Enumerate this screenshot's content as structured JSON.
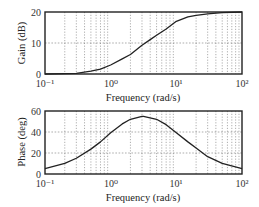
{
  "chart_data": [
    {
      "type": "line",
      "title": "",
      "xlabel": "Frequency (rad/s)",
      "ylabel": "Gain (dB)",
      "xscale": "log",
      "xlim": [
        0.1,
        100
      ],
      "ylim": [
        0,
        20
      ],
      "xticks": [
        "10⁻¹",
        "10⁰",
        "10¹",
        "10²"
      ],
      "yticks": [
        "0",
        "10",
        "20"
      ],
      "grid": true,
      "series": [
        {
          "name": "Gain",
          "x": [
            0.1,
            0.2,
            0.3,
            0.5,
            0.7,
            1,
            1.5,
            2,
            3,
            4,
            5,
            7,
            10,
            15,
            20,
            30,
            50,
            100
          ],
          "values": [
            0.0,
            0.1,
            0.2,
            0.9,
            1.6,
            2.9,
            4.9,
            6.3,
            9.3,
            11.1,
            12.5,
            14.5,
            17.0,
            18.4,
            18.9,
            19.4,
            19.8,
            20.0
          ]
        }
      ]
    },
    {
      "type": "line",
      "title": "",
      "xlabel": "Frequency (rad/s)",
      "ylabel": "Phase (deg)",
      "xscale": "log",
      "xlim": [
        0.1,
        100
      ],
      "ylim": [
        0,
        60
      ],
      "xticks": [
        "10⁻¹",
        "10⁰",
        "10¹",
        "10²"
      ],
      "yticks": [
        "0",
        "20",
        "40",
        "60"
      ],
      "grid": true,
      "series": [
        {
          "name": "Phase",
          "x": [
            0.1,
            0.2,
            0.3,
            0.5,
            0.7,
            1,
            1.5,
            2,
            3,
            3.16,
            5,
            7,
            10,
            15,
            20,
            30,
            50,
            100
          ],
          "values": [
            5.1,
            10.2,
            15.0,
            23.7,
            30.6,
            39.3,
            47.7,
            52.1,
            54.9,
            54.9,
            52.1,
            47.0,
            39.3,
            30.6,
            24.8,
            16.5,
            10.2,
            5.1
          ]
        }
      ]
    }
  ],
  "plots": {
    "gain": {
      "ylabel": "Gain (dB)",
      "xlabel": "Frequency (rad/s)",
      "yticks": [
        "0",
        "10",
        "20"
      ],
      "xticks": [
        "10⁻¹",
        "10⁰",
        "10¹",
        "10²"
      ]
    },
    "phase": {
      "ylabel": "Phase (deg)",
      "xlabel": "Frequency (rad/s)",
      "yticks": [
        "0",
        "20",
        "40",
        "60"
      ],
      "xticks": [
        "10⁻¹",
        "10⁰",
        "10¹",
        "10²"
      ]
    }
  }
}
